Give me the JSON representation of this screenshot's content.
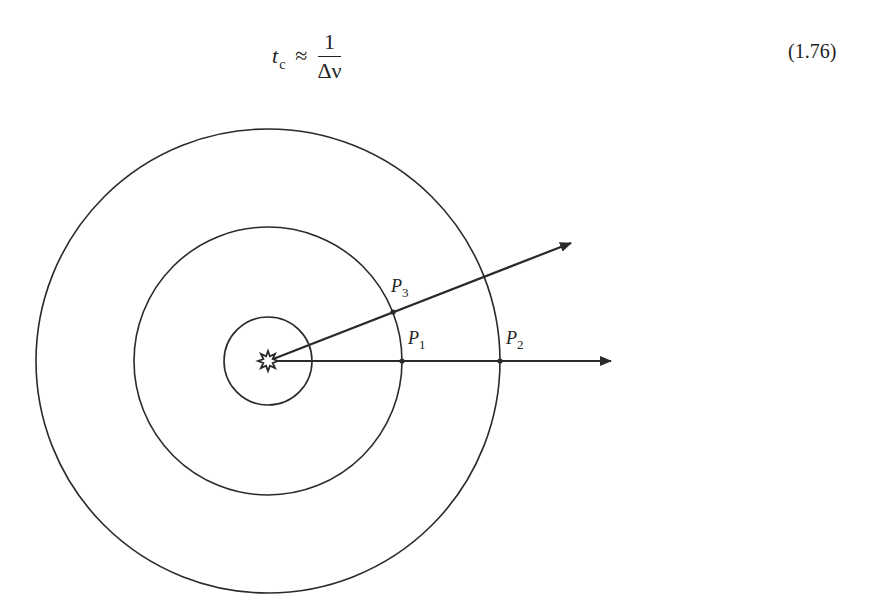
{
  "equation": {
    "lhs_symbol": "t",
    "lhs_subscript": "c",
    "relation": "≈",
    "numerator": "1",
    "denominator": "Δν",
    "number": "(1.76)"
  },
  "figure": {
    "center": {
      "x": 268,
      "y": 361
    },
    "source_icon": "star-burst-source",
    "circles": [
      {
        "name": "inner",
        "radius": 44
      },
      {
        "name": "middle",
        "radius": 134
      },
      {
        "name": "outer",
        "radius": 232
      }
    ],
    "rays": [
      {
        "name": "horizontal-ray",
        "tip": {
          "x": 611,
          "y": 361
        }
      },
      {
        "name": "oblique-ray",
        "tip": {
          "x": 571,
          "y": 243
        }
      }
    ],
    "points": [
      {
        "label": "P",
        "sub": "1",
        "x": 402,
        "y": 361,
        "label_x": 408,
        "label_y": 344
      },
      {
        "label": "P",
        "sub": "2",
        "x": 500,
        "y": 361,
        "label_x": 506,
        "label_y": 344
      },
      {
        "label": "P",
        "sub": "3",
        "x": 393,
        "y": 312,
        "label_x": 391,
        "label_y": 292
      }
    ],
    "stroke_color": "#2a2a2a"
  }
}
